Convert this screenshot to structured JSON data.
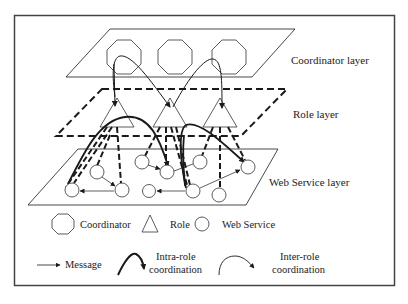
{
  "figure": {
    "layers": [
      {
        "id": "coordinator",
        "label": "Coordinator layer"
      },
      {
        "id": "role",
        "label": "Role layer"
      },
      {
        "id": "webservice",
        "label": "Web Service layer"
      }
    ],
    "coordinators": [
      {
        "id": "c1"
      },
      {
        "id": "c2"
      },
      {
        "id": "c3"
      }
    ],
    "roles": [
      {
        "id": "r1"
      },
      {
        "id": "r2"
      },
      {
        "id": "r3"
      }
    ],
    "web_services_count": 10,
    "legend": {
      "coordinator": "Coordinator",
      "role": "Role",
      "web_service": "Web Service",
      "message": "Message",
      "intra_role_line1": "Intra-role",
      "intra_role_line2": "coordination",
      "inter_role_line1": "Inter-role",
      "inter_role_line2": "coordination"
    },
    "colors": {
      "stroke": "#1a1a1a",
      "frame": "#444444",
      "background": "#ffffff"
    }
  }
}
